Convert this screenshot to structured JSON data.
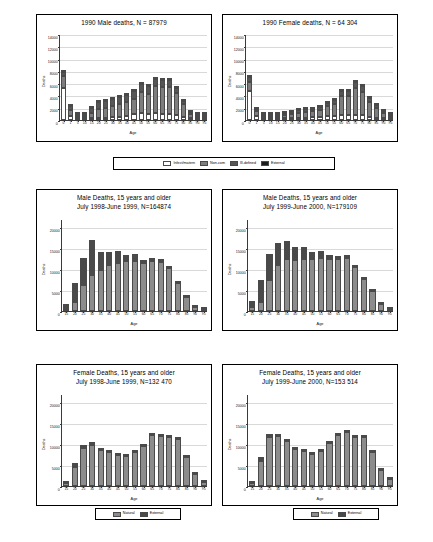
{
  "figure": {
    "axis_labels": {
      "x": "Age",
      "y": "Deaths"
    }
  },
  "legends": {
    "cause4": {
      "items": [
        {
          "label": "Infect/matern",
          "color": "#ffffff"
        },
        {
          "label": "Non-com",
          "color": "#7d7d7d"
        },
        {
          "label": "Ill-defined",
          "color": "#565656"
        },
        {
          "label": "External",
          "color": "#1c1c1c"
        }
      ]
    },
    "cause2_a": {
      "items": [
        {
          "label": "Natural",
          "color": "#8c8c8c"
        },
        {
          "label": "External",
          "color": "#4a4a4a"
        }
      ]
    },
    "cause2_b": {
      "items": [
        {
          "label": "Natural",
          "color": "#8c8c8c"
        },
        {
          "label": "External",
          "color": "#4a4a4a"
        }
      ]
    }
  },
  "chart_data": [
    {
      "id": "male-1990",
      "type": "bar",
      "stacked": true,
      "title": [
        "1990 Male deaths, N = 87979"
      ],
      "xlabel": "Age",
      "ylabel": "Deaths",
      "ylim": [
        0,
        14000
      ],
      "yticks": [
        0,
        2000,
        4000,
        6000,
        8000,
        10000,
        12000,
        14000
      ],
      "grid": true,
      "categories": [
        "0",
        "1",
        "5",
        "10",
        "15",
        "20",
        "25",
        "30",
        "35",
        "40",
        "45",
        "50",
        "55",
        "60",
        "65",
        "70",
        "75",
        "80",
        "85",
        "90",
        "95"
      ],
      "series": [
        {
          "name": "Infect/matern",
          "color": "#ffffff",
          "values": [
            5400,
            800,
            260,
            150,
            170,
            300,
            330,
            420,
            520,
            640,
            1000,
            1150,
            1050,
            1100,
            1080,
            1040,
            780,
            420,
            200,
            70,
            25
          ]
        },
        {
          "name": "Non-com",
          "color": "#7d7d7d",
          "values": [
            1900,
            1050,
            480,
            460,
            1050,
            1550,
            1600,
            1800,
            2050,
            2300,
            2500,
            3550,
            3400,
            4600,
            4450,
            4600,
            3800,
            2400,
            1170,
            400,
            160
          ]
        },
        {
          "name": "Ill-defined",
          "color": "#565656",
          "values": [
            650,
            560,
            160,
            300,
            760,
            1100,
            1200,
            1250,
            1250,
            1150,
            1250,
            1300,
            1250,
            1200,
            1180,
            1150,
            850,
            560,
            250,
            80,
            30
          ]
        },
        {
          "name": "External",
          "color": "#1c1c1c",
          "values": [
            130,
            120,
            100,
            130,
            230,
            330,
            350,
            330,
            320,
            280,
            230,
            180,
            150,
            130,
            110,
            100,
            80,
            60,
            30,
            20,
            10
          ]
        }
      ]
    },
    {
      "id": "female-1990",
      "type": "bar",
      "stacked": true,
      "title": [
        "1990 Female deaths, N = 64 304"
      ],
      "xlabel": "Age",
      "ylabel": "Deaths",
      "ylim": [
        0,
        14000
      ],
      "yticks": [
        0,
        2000,
        4000,
        6000,
        8000,
        10000,
        12000,
        14000
      ],
      "grid": true,
      "categories": [
        "0",
        "1",
        "5",
        "10",
        "15",
        "20",
        "25",
        "30",
        "35",
        "40",
        "45",
        "50",
        "55",
        "60",
        "65",
        "70",
        "75",
        "80",
        "85",
        "90",
        "95"
      ],
      "series": [
        {
          "name": "Infect/matern",
          "color": "#ffffff",
          "values": [
            4900,
            760,
            230,
            120,
            180,
            300,
            330,
            380,
            420,
            470,
            560,
            620,
            650,
            820,
            800,
            900,
            800,
            520,
            380,
            220,
            90
          ]
        },
        {
          "name": "Non-com",
          "color": "#7d7d7d",
          "values": [
            1500,
            930,
            170,
            200,
            480,
            680,
            760,
            900,
            1000,
            1100,
            1250,
            1800,
            2200,
            3300,
            3350,
            4450,
            3900,
            2700,
            1900,
            1250,
            560
          ]
        },
        {
          "name": "Ill-defined",
          "color": "#565656",
          "values": [
            800,
            400,
            120,
            170,
            250,
            350,
            400,
            450,
            480,
            480,
            520,
            520,
            620,
            780,
            780,
            1050,
            1050,
            680,
            450,
            300,
            130
          ]
        },
        {
          "name": "External",
          "color": "#1c1c1c",
          "values": [
            120,
            110,
            70,
            110,
            140,
            150,
            150,
            150,
            150,
            140,
            130,
            110,
            110,
            100,
            90,
            90,
            80,
            60,
            40,
            25,
            10
          ]
        }
      ]
    },
    {
      "id": "male-1998-1999",
      "type": "bar",
      "stacked": true,
      "title": [
        "Male Deaths, 15 years and older",
        "July 1998-June 1999, N=164874"
      ],
      "xlabel": "Age",
      "ylabel": "Deaths",
      "ylim": [
        0,
        22000
      ],
      "yticks": [
        0,
        5000,
        10000,
        15000,
        20000
      ],
      "grid": true,
      "categories": [
        "15",
        "20",
        "25",
        "30",
        "35",
        "40",
        "45",
        "50",
        "55",
        "60",
        "65",
        "70",
        "75",
        "80",
        "85",
        "90",
        "95"
      ],
      "series": [
        {
          "name": "Natural",
          "color": "#8c8c8c",
          "values": [
            600,
            2200,
            6200,
            8500,
            9700,
            10900,
            11600,
            12000,
            12000,
            11400,
            11900,
            11700,
            10300,
            6800,
            3600,
            1300,
            450
          ]
        },
        {
          "name": "External",
          "color": "#4a4a4a",
          "values": [
            1000,
            4500,
            6400,
            8500,
            4400,
            3100,
            2700,
            1500,
            1700,
            800,
            800,
            700,
            400,
            300,
            200,
            100,
            50
          ]
        }
      ]
    },
    {
      "id": "male-1999-2000",
      "type": "bar",
      "stacked": true,
      "title": [
        "Male Deaths, 15 years and older",
        "July 1999-June 2000, N=179109"
      ],
      "xlabel": "Age",
      "ylabel": "Deaths",
      "ylim": [
        0,
        22000
      ],
      "yticks": [
        0,
        5000,
        10000,
        15000,
        20000
      ],
      "grid": true,
      "categories": [
        "15",
        "20",
        "25",
        "30",
        "35",
        "40",
        "45",
        "50",
        "55",
        "60",
        "65",
        "70",
        "75",
        "80",
        "85",
        "90",
        "95"
      ],
      "series": [
        {
          "name": "Natural",
          "color": "#8c8c8c",
          "values": [
            900,
            2200,
            7500,
            11100,
            12500,
            12300,
            12500,
            12500,
            12600,
            12500,
            12400,
            12700,
            10500,
            7900,
            5000,
            2000,
            800
          ]
        },
        {
          "name": "External",
          "color": "#4a4a4a",
          "values": [
            1500,
            5200,
            6100,
            5200,
            4200,
            3100,
            2700,
            1700,
            1700,
            800,
            800,
            800,
            600,
            300,
            200,
            100,
            50
          ]
        }
      ]
    },
    {
      "id": "female-1998-1999",
      "type": "bar",
      "stacked": true,
      "title": [
        "Female Deaths, 15 years and older",
        "July 1998-June 1999, N=132 470"
      ],
      "xlabel": "Age",
      "ylabel": "Deaths",
      "ylim": [
        0,
        22000
      ],
      "yticks": [
        0,
        5000,
        10000,
        15000,
        20000
      ],
      "grid": true,
      "categories": [
        "15",
        "20",
        "25",
        "30",
        "35",
        "40",
        "45",
        "50",
        "55",
        "60",
        "65",
        "70",
        "75",
        "80",
        "85",
        "90",
        "95"
      ],
      "series": [
        {
          "name": "Natural",
          "color": "#8c8c8c",
          "values": [
            800,
            4500,
            9000,
            9800,
            8700,
            8100,
            7700,
            7300,
            8300,
            9800,
            12300,
            11900,
            11700,
            11400,
            7300,
            3300,
            1500
          ]
        },
        {
          "name": "External",
          "color": "#4a4a4a",
          "values": [
            350,
            1000,
            800,
            700,
            500,
            400,
            300,
            250,
            300,
            350,
            450,
            450,
            400,
            400,
            150,
            100,
            50
          ]
        }
      ]
    },
    {
      "id": "female-1999-2000",
      "type": "bar",
      "stacked": true,
      "title": [
        "Female Deaths, 15 years and older",
        "July 1999-June 2000, N=153 514"
      ],
      "xlabel": "Age",
      "ylabel": "Deaths",
      "ylim": [
        0,
        22000
      ],
      "yticks": [
        0,
        5000,
        10000,
        15000,
        20000
      ],
      "grid": true,
      "categories": [
        "15",
        "20",
        "25",
        "30",
        "35",
        "40",
        "45",
        "50",
        "55",
        "60",
        "65",
        "70",
        "75",
        "80",
        "85",
        "90",
        "95"
      ],
      "series": [
        {
          "name": "Natural",
          "color": "#8c8c8c",
          "values": [
            1100,
            6000,
            11800,
            11900,
            10800,
            9000,
            8600,
            7900,
            8500,
            10300,
            12200,
            12900,
            11700,
            11800,
            8500,
            4300,
            2000
          ]
        },
        {
          "name": "External",
          "color": "#4a4a4a",
          "values": [
            200,
            900,
            700,
            600,
            450,
            400,
            300,
            250,
            300,
            400,
            500,
            500,
            400,
            400,
            200,
            100,
            50
          ]
        }
      ]
    }
  ]
}
